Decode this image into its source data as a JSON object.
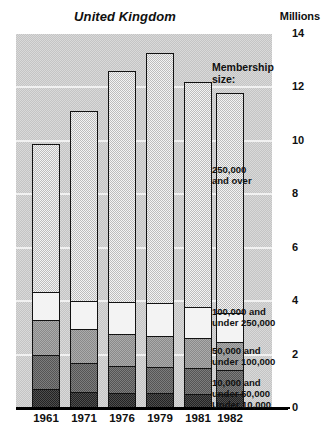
{
  "chart_data": {
    "type": "bar",
    "title": "United Kingdom",
    "subtitle": "",
    "units_label": "Millions",
    "xlabel": "",
    "ylabel": "Millions",
    "ylim": [
      0,
      14
    ],
    "yticks": [
      0,
      2,
      4,
      6,
      8,
      10,
      12,
      14
    ],
    "ytick_labels": [
      "0",
      "2",
      "4",
      "6",
      "8",
      "10",
      "12",
      "14"
    ],
    "grid": true,
    "stacked": true,
    "legend_position": "right-inside",
    "legend_title": "Membership size:",
    "categories": [
      "1961",
      "1971",
      "1976",
      "1979",
      "1981",
      "1982"
    ],
    "series": [
      {
        "name": "Under 10,000",
        "values": [
          0.65,
          0.55,
          0.5,
          0.5,
          0.45,
          0.45
        ]
      },
      {
        "name": "10,000 and under 50,000",
        "values": [
          1.25,
          1.05,
          1.0,
          0.95,
          0.95,
          0.9
        ]
      },
      {
        "name": "50,000 and under 100,000",
        "values": [
          1.3,
          1.25,
          1.15,
          1.15,
          1.1,
          1.0
        ]
      },
      {
        "name": "100,000 and under 250,000",
        "values": [
          1.05,
          1.05,
          1.2,
          1.2,
          1.15,
          1.1
        ]
      },
      {
        "name": "250,000 and over",
        "values": [
          5.65,
          7.2,
          8.75,
          9.5,
          8.55,
          8.35
        ]
      }
    ],
    "totals": [
      9.9,
      11.1,
      12.6,
      13.3,
      12.2,
      11.8
    ],
    "annotations": [
      "250,000 and over",
      "100,000 and under 250,000",
      "50,000 and under 100,000",
      "10,000 and under 50,000",
      "Under 10,000"
    ]
  },
  "labels": {
    "legend_title_line1": "Membership",
    "legend_title_line2": "size:",
    "note_over250_line1": "250,000",
    "note_over250_line2": "and over",
    "note_100_line1": "100,000 and",
    "note_100_line2": "under 250,000",
    "note_50_line1": "50,000 and",
    "note_50_line2": "under 100,000",
    "note_10_line1": "10,000 and",
    "note_10_line2": "under 50,000",
    "note_under10": "Under 10,000"
  },
  "colors": {
    "plot_background": "#cfcfcf",
    "bar_outline": "#121212",
    "seg_over_250000": "#e9e9e9",
    "seg_100000_250000": "#f3f3f3",
    "seg_50000_100000": "#9a9a9a",
    "seg_10000_50000": "#6a6a6a",
    "seg_under_10000": "#3a3a3a",
    "text": "#101010",
    "gridline": "#f2f2f2"
  }
}
